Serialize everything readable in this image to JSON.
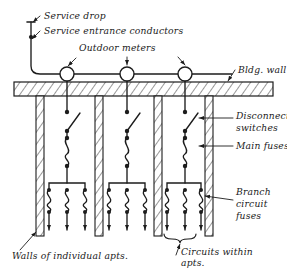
{
  "diagram": {
    "ink_color": "#1c1c1c",
    "background_color": "#ffffff",
    "labels": {
      "service_drop": "Service drop",
      "service_entrance_conductors": "Service entrance conductors",
      "outdoor_meters": "Outdoor meters",
      "bldg_wall": "Bldg. wall",
      "disconnect_switches_l1": "Disconnect",
      "disconnect_switches_l2": "switches",
      "main_fuses": "Main fuses",
      "branch_l1": "Branch",
      "branch_l2": "circuit",
      "branch_l3": "fuses",
      "walls_of_apts": "Walls of individual apts.",
      "circuits_l1": "Circuits within",
      "circuits_l2": "apts."
    },
    "components": {
      "meter_count": 3,
      "meter_centers_x": [
        67,
        127,
        185
      ],
      "meter_line_y": 74,
      "meter_radius": 7,
      "service_drop_x": 31,
      "service_drop_top_y": 22,
      "wall_band_top_y": 82,
      "wall_band_bottom_y": 96,
      "apartment_wall_x": [
        36,
        95,
        154,
        205
      ],
      "apartment_wall_bottom_y": 236,
      "riser_x": [
        67,
        127,
        185
      ],
      "switch_top_dot_y": 112,
      "switch_bottom_dot_y": 131,
      "main_fuse_top_y": 138,
      "main_fuse_bottom_y": 166,
      "bus_bar_y": 183,
      "branch_fuse_count_per_apt": 3,
      "branch_offsets_x": [
        -18,
        0,
        18
      ],
      "branch_fuse_top_y": 190,
      "branch_fuse_bottom_y": 212,
      "branch_lead_bottom_y": 230,
      "brace_y": 238,
      "brace_apartment_index": 3
    }
  }
}
